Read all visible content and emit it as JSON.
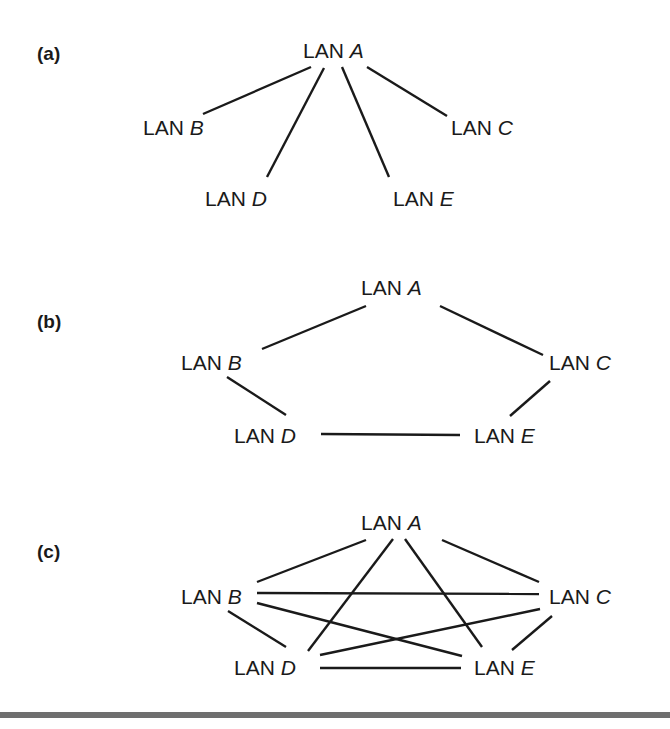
{
  "panels": [
    {
      "id": "a",
      "label": "(a)",
      "label_pos": [
        37,
        44
      ],
      "topology": "star",
      "nodes": [
        {
          "id": "A",
          "prefix": "LAN ",
          "letter": "A",
          "pos": [
            303,
            40
          ]
        },
        {
          "id": "B",
          "prefix": "LAN ",
          "letter": "B",
          "pos": [
            143,
            117
          ]
        },
        {
          "id": "C",
          "prefix": "LAN ",
          "letter": "C",
          "pos": [
            451,
            117
          ]
        },
        {
          "id": "D",
          "prefix": "LAN ",
          "letter": "D",
          "pos": [
            205,
            188
          ]
        },
        {
          "id": "E",
          "prefix": "LAN ",
          "letter": "E",
          "pos": [
            393,
            188
          ]
        }
      ],
      "edges": [
        {
          "from": "A",
          "to": "B",
          "line": [
            311,
            67,
            203,
            114
          ]
        },
        {
          "from": "A",
          "to": "D",
          "line": [
            324,
            68,
            267,
            177
          ]
        },
        {
          "from": "A",
          "to": "E",
          "line": [
            342,
            67,
            389,
            177
          ]
        },
        {
          "from": "A",
          "to": "C",
          "line": [
            367,
            67,
            447,
            116
          ]
        }
      ]
    },
    {
      "id": "b",
      "label": "(b)",
      "label_pos": [
        37,
        312
      ],
      "topology": "ring",
      "nodes": [
        {
          "id": "A",
          "prefix": "LAN ",
          "letter": "A",
          "pos": [
            361,
            277
          ]
        },
        {
          "id": "B",
          "prefix": "LAN ",
          "letter": "B",
          "pos": [
            181,
            352
          ]
        },
        {
          "id": "C",
          "prefix": "LAN ",
          "letter": "C",
          "pos": [
            549,
            352
          ]
        },
        {
          "id": "D",
          "prefix": "LAN ",
          "letter": "D",
          "pos": [
            234,
            425
          ]
        },
        {
          "id": "E",
          "prefix": "LAN ",
          "letter": "E",
          "pos": [
            474,
            425
          ]
        }
      ],
      "edges": [
        {
          "from": "A",
          "to": "B",
          "line": [
            366,
            306,
            262,
            349
          ]
        },
        {
          "from": "A",
          "to": "C",
          "line": [
            440,
            306,
            543,
            355
          ]
        },
        {
          "from": "B",
          "to": "D",
          "line": [
            227,
            377,
            286,
            415
          ]
        },
        {
          "from": "C",
          "to": "E",
          "line": [
            550,
            381,
            510,
            416
          ]
        },
        {
          "from": "D",
          "to": "E",
          "line": [
            321,
            434,
            460,
            435
          ]
        }
      ]
    },
    {
      "id": "c",
      "label": "(c)",
      "label_pos": [
        37,
        542
      ],
      "topology": "full-mesh",
      "nodes": [
        {
          "id": "A",
          "prefix": "LAN ",
          "letter": "A",
          "pos": [
            361,
            512
          ]
        },
        {
          "id": "B",
          "prefix": "LAN ",
          "letter": "B",
          "pos": [
            181,
            586
          ]
        },
        {
          "id": "C",
          "prefix": "LAN ",
          "letter": "C",
          "pos": [
            549,
            586
          ]
        },
        {
          "id": "D",
          "prefix": "LAN ",
          "letter": "D",
          "pos": [
            234,
            657
          ]
        },
        {
          "id": "E",
          "prefix": "LAN ",
          "letter": "E",
          "pos": [
            474,
            657
          ]
        }
      ],
      "edges": [
        {
          "from": "A",
          "to": "B",
          "line": [
            366,
            540,
            257,
            582
          ]
        },
        {
          "from": "A",
          "to": "D",
          "line": [
            393,
            539,
            308,
            651
          ]
        },
        {
          "from": "A",
          "to": "E",
          "line": [
            405,
            539,
            482,
            647
          ]
        },
        {
          "from": "A",
          "to": "C",
          "line": [
            442,
            540,
            539,
            582
          ]
        },
        {
          "from": "B",
          "to": "C",
          "line": [
            257,
            593,
            539,
            594
          ]
        },
        {
          "from": "B",
          "to": "E",
          "line": [
            257,
            603,
            462,
            656
          ]
        },
        {
          "from": "B",
          "to": "D",
          "line": [
            228,
            611,
            286,
            647
          ]
        },
        {
          "from": "D",
          "to": "C",
          "line": [
            320,
            655,
            540,
            609
          ]
        },
        {
          "from": "C",
          "to": "E",
          "line": [
            552,
            616,
            512,
            650
          ]
        },
        {
          "from": "D",
          "to": "E",
          "line": [
            320,
            668,
            461,
            668
          ]
        }
      ]
    }
  ],
  "colors": {
    "ink": "#1a1a1a",
    "rule": "#6f6f6f",
    "background": "#ffffff"
  }
}
